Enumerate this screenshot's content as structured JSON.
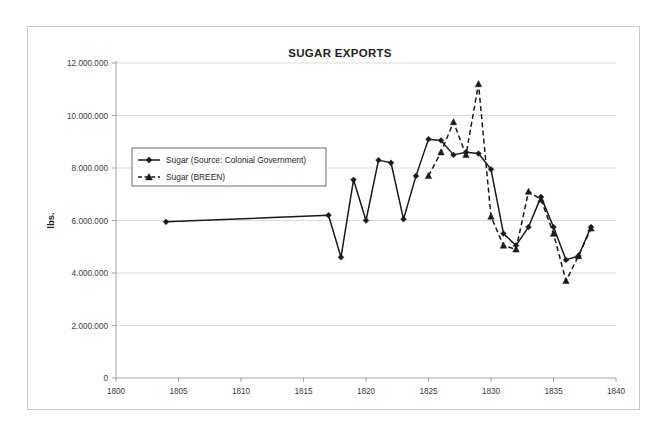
{
  "chart_data": {
    "type": "line",
    "title": "SUGAR EXPORTS",
    "xlabel": "",
    "ylabel": "lbs.",
    "xlim": [
      1800,
      1840
    ],
    "ylim": [
      0,
      12000000
    ],
    "grid": true,
    "legend_position": "upper-left-inside",
    "x_tick_labels": [
      "1800",
      "1805",
      "1810",
      "1815",
      "1820",
      "1825",
      "1830",
      "1835",
      "1840"
    ],
    "x_ticks": [
      1800,
      1805,
      1810,
      1815,
      1820,
      1825,
      1830,
      1835,
      1840
    ],
    "y_tick_labels": [
      "0",
      "2.000.000",
      "4.000.000",
      "6.000.000",
      "8.000.000",
      "10.000.000",
      "12.000.000"
    ],
    "y_ticks": [
      0,
      2000000,
      4000000,
      6000000,
      8000000,
      10000000,
      12000000
    ],
    "series": [
      {
        "name": "Sugar (Source: Colonial Government)",
        "marker": "diamond",
        "linestyle": "solid",
        "color": "#1a1a1a",
        "x": [
          1804,
          1817,
          1818,
          1819,
          1820,
          1821,
          1822,
          1823,
          1824,
          1825,
          1826,
          1827,
          1828,
          1829,
          1830,
          1831,
          1832,
          1833,
          1834,
          1835,
          1836,
          1837,
          1838
        ],
        "values": [
          5950000,
          6200000,
          4600000,
          7550000,
          6000000,
          8300000,
          8200000,
          6050000,
          7700000,
          9100000,
          9050000,
          8500000,
          8600000,
          8550000,
          7950000,
          5500000,
          5050000,
          5750000,
          6900000,
          5750000,
          4500000,
          4650000,
          5750000
        ]
      },
      {
        "name": "Sugar (BREEN)",
        "marker": "triangle",
        "linestyle": "dashed",
        "color": "#1a1a1a",
        "x": [
          1825,
          1826,
          1827,
          1828,
          1829,
          1830,
          1831,
          1832,
          1833,
          1834,
          1835,
          1836,
          1837,
          1838
        ],
        "values": [
          7700000,
          8600000,
          9750000,
          8500000,
          11200000,
          6150000,
          5050000,
          4900000,
          7100000,
          6800000,
          5500000,
          3700000,
          4650000,
          5700000
        ]
      }
    ]
  },
  "legend": {
    "entries": [
      {
        "label": "Sugar (Source: Colonial Government)"
      },
      {
        "label": "Sugar (BREEN)"
      }
    ]
  }
}
